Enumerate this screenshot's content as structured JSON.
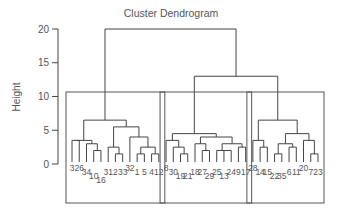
{
  "chart_data": {
    "type": "dendrogram",
    "title": "Cluster Dendrogram",
    "xlabel": "",
    "ylabel": "Height",
    "ylim": [
      0,
      20
    ],
    "yticks": [
      0,
      5,
      10,
      15,
      20
    ],
    "grid": false,
    "leaf_order": [
      3,
      26,
      34,
      10,
      16,
      31,
      2,
      33,
      32,
      1,
      5,
      4,
      12,
      8,
      30,
      19,
      21,
      18,
      27,
      29,
      25,
      13,
      24,
      9,
      17,
      28,
      14,
      15,
      22,
      35,
      6,
      11,
      20,
      7,
      23
    ],
    "leaf_label_offsets": [
      0,
      0,
      1,
      2,
      3,
      1,
      1,
      1,
      0,
      1,
      1,
      1,
      1,
      0,
      1,
      2,
      2,
      1,
      1,
      2,
      1,
      2,
      1,
      1,
      1,
      0,
      1,
      1,
      2,
      2,
      1,
      1,
      0,
      1,
      1
    ],
    "tree": {
      "h": 20.0,
      "c": [
        {
          "h": 10.5,
          "c": [
            {
              "h": 6.5,
              "c": [
                {
                  "h": 3.5,
                  "c": [
                    {
                      "h": 3.5,
                      "c": [
                        "3",
                        "26"
                      ]
                    },
                    {
                      "h": 3.0,
                      "c": [
                        "34",
                        {
                          "h": 2.0,
                          "c": [
                            "10",
                            "16"
                          ]
                        }
                      ]
                    }
                  ]
                },
                {
                  "h": 5.5,
                  "c": [
                    {
                      "h": 2.5,
                      "c": [
                        "31",
                        {
                          "h": 1.5,
                          "c": [
                            "2",
                            "33"
                          ]
                        }
                      ]
                    },
                    {
                      "h": 4.0,
                      "c": [
                        "32",
                        {
                          "h": 2.5,
                          "c": [
                            {
                              "h": 1.5,
                              "c": [
                                "1",
                                "5"
                              ]
                            },
                            {
                              "h": 1.5,
                              "c": [
                                "4",
                                "12"
                              ]
                            }
                          ]
                        }
                      ]
                    }
                  ]
                }
              ]
            }
          ]
        },
        {
          "h": 13.0,
          "c": [
            {
              "h": 10.5,
              "c": [
                {
                  "h": 4.5,
                  "c": [
                    {
                      "h": 3.5,
                      "c": [
                        "8",
                        {
                          "h": 2.5,
                          "c": [
                            "30",
                            {
                              "h": 1.5,
                              "c": [
                                "19",
                                "21"
                              ]
                            }
                          ]
                        }
                      ]
                    },
                    {
                      "h": 4.0,
                      "c": [
                        {
                          "h": 3.0,
                          "c": [
                            "18",
                            {
                              "h": 2.0,
                              "c": [
                                "27",
                                "29"
                              ]
                            }
                          ]
                        },
                        {
                          "h": 3.0,
                          "c": [
                            {
                              "h": 2.0,
                              "c": [
                                "25",
                                {
                                  "h": 2.0,
                                  "c": [
                                    "13",
                                    "24"
                                  ]
                                }
                              ]
                            },
                            {
                              "h": 2.5,
                              "c": [
                                "9",
                                "17"
                              ]
                            }
                          ]
                        }
                      ]
                    }
                  ]
                }
              ]
            },
            {
              "h": 10.5,
              "c": [
                {
                  "h": 6.5,
                  "c": [
                    {
                      "h": 3.5,
                      "c": [
                        "28",
                        {
                          "h": 2.5,
                          "c": [
                            "14",
                            "15"
                          ]
                        }
                      ]
                    },
                    {
                      "h": 4.5,
                      "c": [
                        {
                          "h": 3.0,
                          "c": [
                            {
                              "h": 1.5,
                              "c": [
                                "22",
                                "35"
                              ]
                            },
                            {
                              "h": 2.5,
                              "c": [
                                "6",
                                "11"
                              ]
                            }
                          ]
                        },
                        {
                          "h": 3.5,
                          "c": [
                            "20",
                            {
                              "h": 1.5,
                              "c": [
                                "7",
                                "23"
                              ]
                            }
                          ]
                        }
                      ]
                    }
                  ]
                }
              ]
            }
          ]
        }
      ]
    },
    "cluster_boxes": [
      {
        "label": "cluster-1",
        "leaves": [
          "3",
          "26",
          "34",
          "10",
          "16",
          "31",
          "2",
          "33",
          "32",
          "1",
          "5",
          "4",
          "12"
        ]
      },
      {
        "label": "cluster-2",
        "leaves": [
          "8",
          "30",
          "19",
          "21",
          "18",
          "27",
          "29",
          "25",
          "13",
          "24",
          "9",
          "17"
        ]
      },
      {
        "label": "cluster-3",
        "leaves": [
          "28",
          "14",
          "15",
          "22",
          "35",
          "6",
          "11",
          "20",
          "7",
          "23"
        ]
      }
    ]
  },
  "colors": {
    "branch": "#444444",
    "text": "#555555",
    "box": "#555555"
  }
}
